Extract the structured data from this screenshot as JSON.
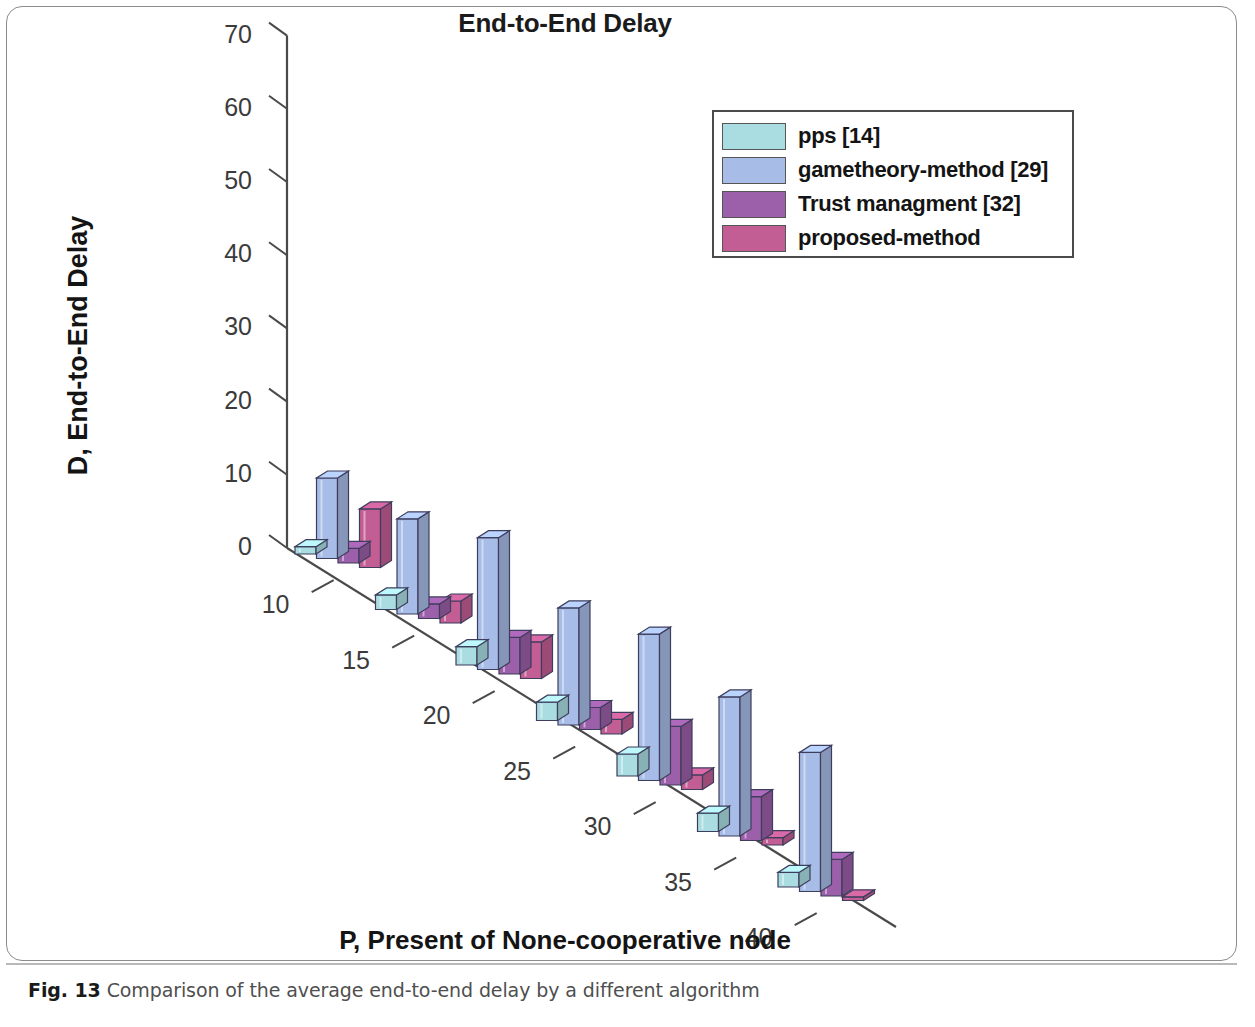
{
  "figure": {
    "caption_prefix": "Fig. 13",
    "caption_text": "Comparison of the average end-to-end delay by a different algorithm"
  },
  "chart_data": {
    "type": "bar",
    "style": "3d-grouped-bar",
    "title": "End-to-End Delay",
    "xlabel": "P, Present of None-cooperative node",
    "ylabel": "D, End-to-End Delay",
    "categories": [
      "10",
      "15",
      "20",
      "25",
      "30",
      "35",
      "40"
    ],
    "yticks": [
      "0",
      "10",
      "20",
      "30",
      "40",
      "50",
      "60",
      "70"
    ],
    "ylim": [
      0,
      70
    ],
    "grid": false,
    "legend_position": "upper right",
    "series": [
      {
        "name": "pps [14]",
        "color": "#a9dde1",
        "values": [
          1,
          2,
          2.5,
          2.5,
          3,
          2.5,
          2
        ]
      },
      {
        "name": "gametheory-method [29]",
        "color": "#a7bce7",
        "values": [
          11,
          13,
          18,
          16,
          20,
          19,
          19
        ]
      },
      {
        "name": "Trust managment [32]",
        "color": "#9c5fa9",
        "values": [
          2,
          2,
          5,
          3,
          8,
          6,
          5
        ]
      },
      {
        "name": "proposed-method",
        "color": "#c35e95",
        "values": [
          8,
          3,
          5,
          2,
          2,
          1,
          0.5
        ]
      }
    ]
  }
}
